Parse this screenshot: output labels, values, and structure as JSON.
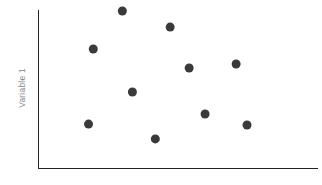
{
  "chart_data": {
    "type": "scatter",
    "title": "",
    "xlabel": "",
    "ylabel": "Variable 1",
    "grid": false,
    "legend": null,
    "marker_color": "#3a3a3a",
    "marker_size_px": 9,
    "axis_color": "#222222",
    "label_color": "#8a8a8a",
    "background_color": "#ffffff",
    "xlim": [
      0,
      100
    ],
    "ylim": [
      0,
      100
    ],
    "x_tick_labels": [],
    "y_tick_labels": [],
    "points": [
      {
        "x": 30.0,
        "y": 99.4
      },
      {
        "x": 47.1,
        "y": 89.2
      },
      {
        "x": 19.6,
        "y": 75.3
      },
      {
        "x": 53.9,
        "y": 63.3
      },
      {
        "x": 70.7,
        "y": 65.8
      },
      {
        "x": 33.6,
        "y": 48.1
      },
      {
        "x": 59.6,
        "y": 34.2
      },
      {
        "x": 17.9,
        "y": 27.8
      },
      {
        "x": 74.6,
        "y": 27.2
      },
      {
        "x": 41.8,
        "y": 18.4
      }
    ]
  },
  "axes": {
    "y_axis_label": "Variable 1",
    "x_axis_label": ""
  }
}
